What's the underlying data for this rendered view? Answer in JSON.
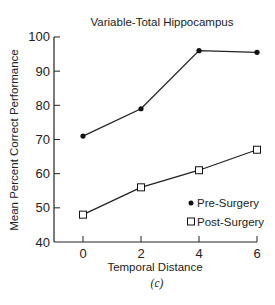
{
  "chart_data": {
    "type": "line",
    "title": "Variable-Total Hippocampus",
    "xlabel": "Temporal Distance",
    "ylabel": "Mean Percent Correct Performance",
    "caption": "(c)",
    "x": [
      0,
      2,
      4,
      6
    ],
    "x_ticks": [
      "0",
      "2",
      "4",
      "6"
    ],
    "y_ticks": [
      "40",
      "50",
      "60",
      "70",
      "80",
      "90",
      "100"
    ],
    "ylim": [
      40,
      100
    ],
    "xlim": [
      -1,
      6
    ],
    "grid": false,
    "legend_position": "lower right",
    "series": [
      {
        "name": "Pre-Surgery",
        "marker": "filled-circle",
        "values": [
          71,
          79,
          96,
          95.5
        ]
      },
      {
        "name": "Post-Surgery",
        "marker": "open-square",
        "values": [
          48,
          56,
          61,
          67
        ]
      }
    ]
  },
  "legend": {
    "pre_label": "• Pre-Surgery",
    "post_label": "□ Post-Surgery"
  }
}
